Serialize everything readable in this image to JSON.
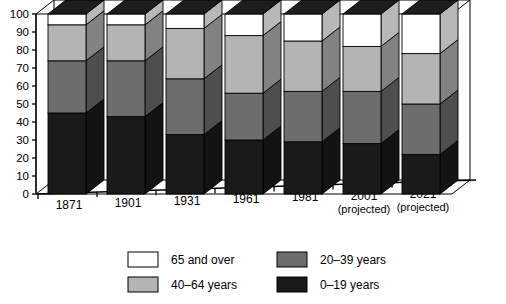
{
  "chart_data": {
    "type": "bar",
    "title": "",
    "subtitle": "",
    "xlabel": "",
    "ylabel": "",
    "stacked": true,
    "percent": true,
    "grid": false,
    "legend_position": "bottom",
    "ylim": [
      0,
      100
    ],
    "ytick_step": 10,
    "yticks": [
      "0",
      "10",
      "20",
      "30",
      "40",
      "50",
      "60",
      "70",
      "80",
      "90",
      "100"
    ],
    "categories": [
      "1871",
      "1901",
      "1931",
      "1961",
      "1981",
      "2001",
      "2021"
    ],
    "category_notes": [
      "",
      "",
      "",
      "",
      "",
      "(projected)",
      "(projected)"
    ],
    "series": [
      {
        "name": "0–19 years",
        "color": "#1a1a1a",
        "values": [
          45,
          43,
          33,
          30,
          29,
          28,
          22
        ]
      },
      {
        "name": "20–39 years",
        "color": "#6d6d6d",
        "values": [
          29,
          31,
          31,
          26,
          28,
          29,
          28
        ]
      },
      {
        "name": "40–64 years",
        "color": "#b4b4b4",
        "values": [
          20,
          20,
          28,
          32,
          28,
          25,
          28
        ]
      },
      {
        "name": "65 and over",
        "color": "#ffffff",
        "values": [
          6,
          6,
          8,
          12,
          15,
          18,
          22
        ]
      }
    ],
    "legend": [
      {
        "label": "65 and over",
        "color": "#ffffff"
      },
      {
        "label": "20–39 years",
        "color": "#6d6d6d"
      },
      {
        "label": "40–64 years",
        "color": "#b4b4b4"
      },
      {
        "label": "0–19 years",
        "color": "#1a1a1a"
      }
    ]
  },
  "colors": {
    "axis": "#000000",
    "outline": "#000000",
    "background": "#ffffff",
    "side_shade": "#000000"
  }
}
